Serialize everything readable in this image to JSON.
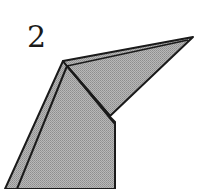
{
  "diagram": {
    "type": "origami-step",
    "step_number": "2",
    "colors": {
      "paper_fill": "#a8a8a8",
      "paper_fill_light": "#b4b4b4",
      "outline": "#1a1a1a",
      "background": "#ffffff"
    }
  }
}
